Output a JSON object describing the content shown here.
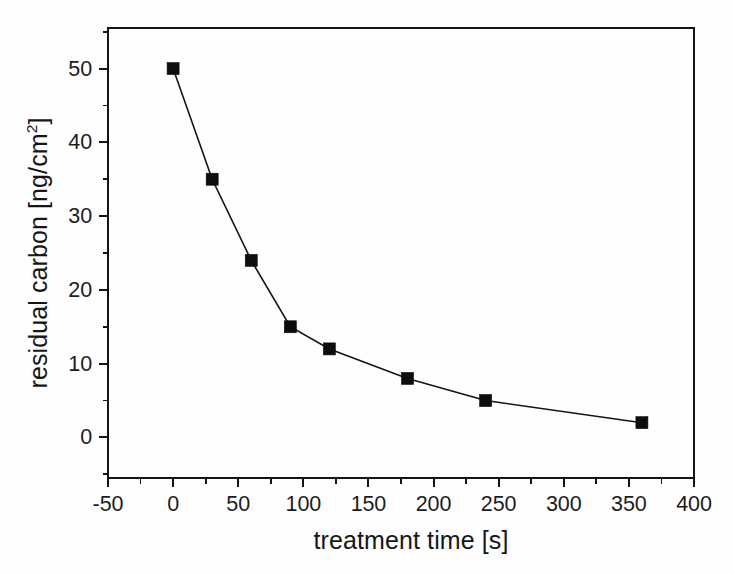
{
  "chart_data": {
    "type": "line",
    "title": "",
    "subtitle": "",
    "xlabel": "treatment time [s]",
    "ylabel_text": "residual carbon [ng/cm",
    "ylabel_sup": "2",
    "ylabel_tail": "]",
    "ylabel_full": "residual carbon [ng/cm2]",
    "x": [
      0,
      30,
      60,
      90,
      120,
      180,
      240,
      360
    ],
    "values": [
      50,
      35,
      24,
      15,
      12,
      8,
      5,
      2
    ],
    "series": [
      {
        "name": "residual carbon",
        "marker": "filled-square",
        "color": "#0d0d0d",
        "values": [
          50,
          35,
          24,
          15,
          12,
          8,
          5,
          2
        ]
      }
    ],
    "xlim": [
      -50,
      400
    ],
    "ylim": [
      -5.5,
      55.5
    ],
    "xticks": [
      -50,
      0,
      50,
      100,
      150,
      200,
      250,
      300,
      350,
      400
    ],
    "xticklabels": [
      "-50",
      "0",
      "50",
      "100",
      "150",
      "200",
      "250",
      "300",
      "350",
      "400"
    ],
    "xminor_step": 25,
    "yticks": [
      0,
      10,
      20,
      30,
      40,
      50
    ],
    "yticklabels": [
      "0",
      "10",
      "20",
      "30",
      "40",
      "50"
    ],
    "yminor_step": 5,
    "grid": false,
    "legend": null,
    "legend_position": "none",
    "tick_direction": "out",
    "frame": "box",
    "annotations": []
  },
  "figure": {
    "background_color": "#fefefe",
    "axis_color": "#141414",
    "marker_color": "#0d0d0d",
    "line_color": "#141414"
  }
}
